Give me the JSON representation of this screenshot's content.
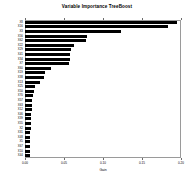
{
  "chart_data": {
    "type": "bar",
    "orientation": "horizontal",
    "title": "Variable Importance TreeBoost",
    "xlabel": "Gain",
    "ylabel": "",
    "xlim": [
      0.0,
      0.2
    ],
    "xticks": [
      0.0,
      0.05,
      0.1,
      0.15,
      0.2
    ],
    "xtick_labels": [
      "0.00",
      "0.05",
      "0.10",
      "0.15",
      "0.20"
    ],
    "grid": false,
    "legend": null,
    "bar_color": "#000000",
    "categories": [
      "X8",
      "X16",
      "X3",
      "X56",
      "X62",
      "X22",
      "X29",
      "X41",
      "X34",
      "X7",
      "X60",
      "X19",
      "X38",
      "X13",
      "X25",
      "X50",
      "X70",
      "X57",
      "X63",
      "X12",
      "X46",
      "X39",
      "X55",
      "X2",
      "X31",
      "X48",
      "X5",
      "X67",
      "X10",
      "X44"
    ],
    "values": [
      0.195,
      0.1835,
      0.123,
      0.079,
      0.0785,
      0.0625,
      0.0585,
      0.058,
      0.0575,
      0.057,
      0.033,
      0.025,
      0.0245,
      0.019,
      0.013,
      0.011,
      0.01,
      0.0095,
      0.009,
      0.0085,
      0.008,
      0.0078,
      0.0075,
      0.0072,
      0.007,
      0.0068,
      0.0065,
      0.0062,
      0.006,
      0.0058
    ]
  }
}
